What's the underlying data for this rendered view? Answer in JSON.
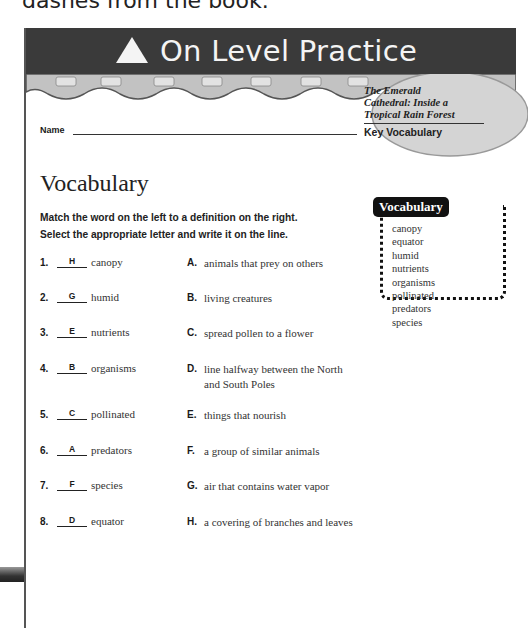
{
  "top_caption": "dashes from the book.",
  "header": {
    "icon": "triangle-icon",
    "title": "On Level Practice"
  },
  "badge": {
    "book_title_line1": "The Emerald",
    "book_title_line2": "Cathedral: Inside a",
    "book_title_line3": "Tropical Rain Forest",
    "subtitle": "Key Vocabulary"
  },
  "name_field": {
    "label": "Name",
    "value": ""
  },
  "section": {
    "title": "Vocabulary",
    "instructions_line1": "Match the word on the left to a definition on the right.",
    "instructions_line2": "Select the appropriate letter and write it on the line."
  },
  "items": [
    {
      "num": "1.",
      "answer": "H",
      "word": "canopy"
    },
    {
      "num": "2.",
      "answer": "G",
      "word": "humid"
    },
    {
      "num": "3.",
      "answer": "E",
      "word": "nutrients"
    },
    {
      "num": "4.",
      "answer": "B",
      "word": "organisms"
    },
    {
      "num": "5.",
      "answer": "C",
      "word": "pollinated"
    },
    {
      "num": "6.",
      "answer": "A",
      "word": "predators"
    },
    {
      "num": "7.",
      "answer": "F",
      "word": "species"
    },
    {
      "num": "8.",
      "answer": "D",
      "word": "equator"
    }
  ],
  "definitions": [
    {
      "letter": "A.",
      "text": "animals that prey on others"
    },
    {
      "letter": "B.",
      "text": "living creatures"
    },
    {
      "letter": "C.",
      "text": "spread pollen to a flower"
    },
    {
      "letter": "D.",
      "text": "line halfway between the North and South Poles"
    },
    {
      "letter": "E.",
      "text": "things that nourish"
    },
    {
      "letter": "F.",
      "text": "a group of similar animals"
    },
    {
      "letter": "G.",
      "text": "air that contains water vapor"
    },
    {
      "letter": "H.",
      "text": "a covering of branches and leaves"
    }
  ],
  "vocab_box": {
    "title": "Vocabulary",
    "words": [
      "canopy",
      "equator",
      "humid",
      "nutrients",
      "organisms",
      "pollinated",
      "predators",
      "species"
    ]
  },
  "colors": {
    "header_bg": "#3a3a3a",
    "header_text": "#f4f4f4",
    "band_gray": "#bdbdbd"
  }
}
